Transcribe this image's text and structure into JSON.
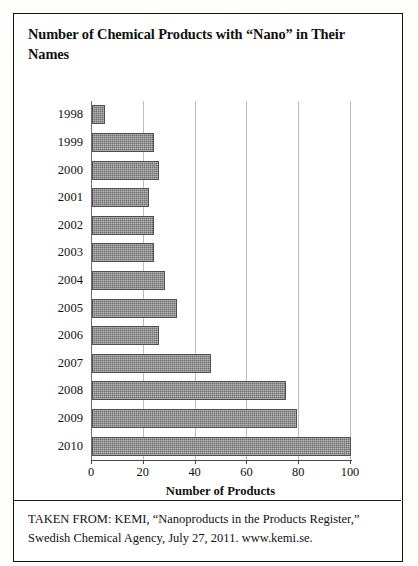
{
  "page": {
    "title": "Number of Chemical Products with “Nano” in Their Names",
    "caption": "TAKEN FROM: KEMI, “Nanoproducts in the Products Register,” Swedish Chemical Agency, July 27, 2011. www.kemi.se."
  },
  "chart_data": {
    "type": "bar",
    "orientation": "horizontal",
    "title": "Number of Chemical Products with “Nano” in Their Names",
    "xlabel": "Number of Products",
    "ylabel": "",
    "categories": [
      "1998",
      "1999",
      "2000",
      "2001",
      "2002",
      "2003",
      "2004",
      "2005",
      "2006",
      "2007",
      "2008",
      "2009",
      "2010"
    ],
    "values": [
      5,
      24,
      26,
      22,
      24,
      24,
      28,
      33,
      26,
      46,
      75,
      79,
      100
    ],
    "xlim": [
      0,
      100
    ],
    "xticks": [
      0,
      20,
      40,
      60,
      80,
      100
    ],
    "xtick_labels": [
      "0",
      "20",
      "40",
      "60",
      "80",
      "100"
    ],
    "grid": "vertical",
    "legend": "none",
    "bar_color": "#6e6e6e",
    "bar_border_color": "#4f4f4f",
    "gridline_color": "#bdbdbd"
  }
}
